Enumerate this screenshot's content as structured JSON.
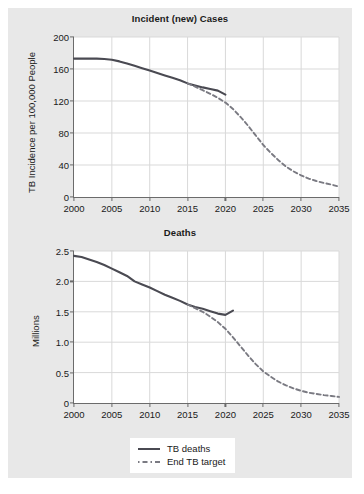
{
  "figure": {
    "background_color": "#e8e8e8",
    "plot_background_color": "#ffffff",
    "axis_color": "#6b6b6b",
    "grid_color": "#d9d9d9",
    "solid_series_color": "#4a4a52",
    "dashed_series_color": "#7a7a82"
  },
  "legend": {
    "items": [
      {
        "label": "TB deaths",
        "style": "solid",
        "icon": "solid-line-icon"
      },
      {
        "label": "End TB target",
        "style": "dashed",
        "icon": "dashed-line-icon"
      }
    ]
  },
  "chart_data": [
    {
      "type": "line",
      "id": "incident-cases",
      "title": "Incident (new) Cases",
      "xlabel": "",
      "ylabel": "TB Incidence per 100,000 People",
      "xlim": [
        2000,
        2035
      ],
      "ylim": [
        0,
        200
      ],
      "xticks": [
        2000,
        2005,
        2010,
        2015,
        2020,
        2025,
        2030,
        2035
      ],
      "xticklabels": [
        "2000",
        "2005",
        "2010",
        "2015",
        "2020",
        "2025",
        "2030",
        "2035"
      ],
      "yticks": [
        0,
        40,
        80,
        120,
        160,
        200
      ],
      "yticklabels": [
        "0",
        "40",
        "80",
        "120",
        "160",
        "200"
      ],
      "grid": true,
      "legend_position": "below-figure",
      "series": [
        {
          "name": "TB deaths",
          "style": "solid",
          "x": [
            2000,
            2001,
            2002,
            2003,
            2004,
            2005,
            2006,
            2007,
            2008,
            2009,
            2010,
            2011,
            2012,
            2013,
            2014,
            2015,
            2016,
            2017,
            2018,
            2019,
            2020
          ],
          "values": [
            173,
            173,
            173,
            173,
            172.5,
            171.5,
            169.5,
            167,
            164,
            161,
            158,
            155,
            152,
            149,
            146,
            142,
            139.5,
            137,
            135,
            133,
            128
          ]
        },
        {
          "name": "End TB target",
          "style": "dashed",
          "x": [
            2015,
            2016,
            2017,
            2018,
            2019,
            2020,
            2021,
            2022,
            2023,
            2024,
            2025,
            2026,
            2027,
            2028,
            2029,
            2030,
            2031,
            2032,
            2033,
            2034,
            2035
          ],
          "values": [
            142,
            138,
            133.5,
            129,
            124,
            118,
            110,
            100,
            89,
            77,
            65,
            55,
            46,
            38,
            32,
            27,
            23,
            20,
            17.5,
            15.5,
            13
          ]
        }
      ]
    },
    {
      "type": "line",
      "id": "deaths",
      "title": "Deaths",
      "xlabel": "",
      "ylabel": "Millions",
      "xlim": [
        2000,
        2035
      ],
      "ylim": [
        0,
        2.5
      ],
      "xticks": [
        2000,
        2005,
        2010,
        2015,
        2020,
        2025,
        2030,
        2035
      ],
      "xticklabels": [
        "2000",
        "2005",
        "2010",
        "2015",
        "2020",
        "2025",
        "2030",
        "2035"
      ],
      "yticks": [
        0,
        0.5,
        1.0,
        1.5,
        2.0,
        2.5
      ],
      "yticklabels": [
        "0",
        "0.5",
        "1.0",
        "1.5",
        "2.0",
        "2.5"
      ],
      "grid": true,
      "legend_position": "below-figure",
      "series": [
        {
          "name": "TB deaths",
          "style": "solid",
          "x": [
            2000,
            2001,
            2002,
            2003,
            2004,
            2005,
            2006,
            2007,
            2008,
            2009,
            2010,
            2011,
            2012,
            2013,
            2014,
            2015,
            2016,
            2017,
            2018,
            2019,
            2020,
            2021
          ],
          "values": [
            2.42,
            2.4,
            2.36,
            2.32,
            2.27,
            2.21,
            2.15,
            2.09,
            2.0,
            1.95,
            1.9,
            1.84,
            1.78,
            1.73,
            1.68,
            1.62,
            1.58,
            1.55,
            1.51,
            1.47,
            1.45,
            1.52
          ]
        },
        {
          "name": "End TB target",
          "style": "dashed",
          "x": [
            2015,
            2016,
            2017,
            2018,
            2019,
            2020,
            2021,
            2022,
            2023,
            2024,
            2025,
            2026,
            2027,
            2028,
            2029,
            2030,
            2031,
            2032,
            2033,
            2034,
            2035
          ],
          "values": [
            1.62,
            1.56,
            1.5,
            1.42,
            1.33,
            1.22,
            1.08,
            0.93,
            0.78,
            0.64,
            0.52,
            0.43,
            0.35,
            0.29,
            0.24,
            0.2,
            0.17,
            0.15,
            0.13,
            0.115,
            0.1
          ]
        }
      ]
    }
  ]
}
